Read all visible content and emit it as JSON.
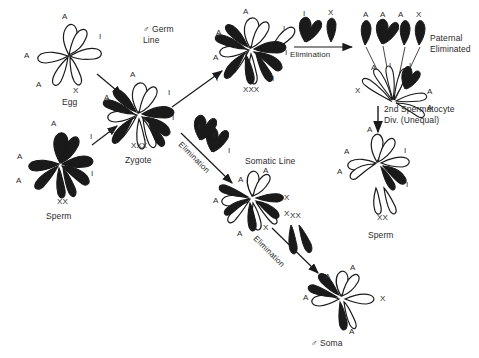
{
  "figure": {
    "background_color": "#ffffff",
    "ink_color": "#1a1a1a",
    "maternal_fill": "#ffffff",
    "paternal_fill": "#1a1a1a"
  },
  "cells": {
    "egg": {
      "name": "Egg",
      "label": "Egg",
      "sex_chromosome_label": "X",
      "chromosome_labels": [
        "A",
        "I",
        "A",
        "A"
      ]
    },
    "sperm": {
      "name": "Sperm",
      "label": "Sperm",
      "sex_chromosome_label": "XX",
      "chromosome_labels": [
        "A",
        "I",
        "A",
        "A",
        "I"
      ]
    },
    "zygote": {
      "name": "Zygote",
      "label": "Zygote",
      "sex_chromosome_label": "XXX",
      "chromosome_labels": [
        "A",
        "A",
        "I",
        "A",
        "I"
      ]
    },
    "germ_line": {
      "name": "Germ line cell",
      "label": "♂ Germ\nLine",
      "sex_chromosome_label": "XXX",
      "chromosome_labels": [
        "A",
        "A",
        "I",
        "I",
        "A",
        "I"
      ]
    },
    "paternal_eliminated": {
      "name": "Paternal eliminated",
      "label": "Paternal\nEliminated",
      "moving_labels": [
        "A",
        "A",
        "A",
        "X"
      ],
      "remaining_labels": [
        "X",
        "A",
        "I",
        "I",
        "A",
        "A"
      ]
    },
    "second_spermatocyte": {
      "name": "Second spermatocyte division",
      "label": "2nd Spermatocyte\nDiv. (Unequal)"
    },
    "sperm_product": {
      "name": "Sperm",
      "label": "Sperm",
      "sex_chromosome_label": "XX",
      "chromosome_labels": [
        "A",
        "A",
        "A",
        "I",
        "I"
      ]
    },
    "somatic_line": {
      "name": "Somatic line cell",
      "label": "Somatic Line",
      "chromosome_labels": [
        "A",
        "A",
        "A",
        "X",
        "X",
        "X",
        "A"
      ]
    },
    "soma": {
      "name": "Male soma",
      "label": "♂ Soma",
      "chromosome_labels": [
        "A",
        "A",
        "A",
        "A",
        "X"
      ]
    }
  },
  "processes": {
    "germ_elimination": {
      "label": "Elimination",
      "eliminated_labels": [
        "I",
        "X"
      ]
    },
    "somatic_elimination": {
      "label": "Elimination",
      "eliminated_labels": [
        "I",
        "I",
        "I"
      ]
    },
    "soma_elimination": {
      "label": "Elimination",
      "eliminated_labels": [
        "XX"
      ]
    }
  }
}
